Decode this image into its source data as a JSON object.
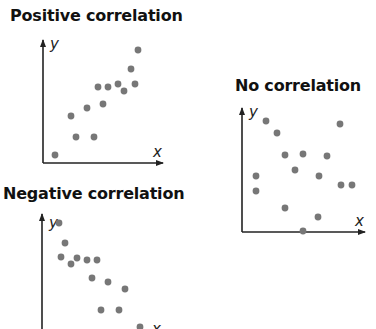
{
  "colors": {
    "dot": "#777777",
    "axis": "#222222",
    "title": "#111111"
  },
  "chart_data": [
    {
      "type": "scatter",
      "title": "Positive correlation",
      "xlabel": "x",
      "ylabel": "y",
      "grid": false,
      "note": "pixel coordinates on a 376x329 canvas",
      "axes": {
        "origin": [
          43,
          163
        ],
        "x_end": 163,
        "y_top": 39
      },
      "x": [
        55,
        71,
        76,
        87,
        94,
        98,
        103,
        108,
        118,
        124,
        131,
        135,
        138
      ],
      "y": [
        155,
        116,
        137,
        108,
        137,
        87,
        104,
        87,
        84,
        91,
        69,
        84,
        50
      ]
    },
    {
      "type": "scatter",
      "title": "No correlation",
      "xlabel": "x",
      "ylabel": "y",
      "grid": false,
      "axes": {
        "origin": [
          242,
          232
        ],
        "x_end": 365,
        "y_top": 107
      },
      "x": [
        266,
        277,
        285,
        303,
        327,
        340,
        256,
        256,
        295,
        319,
        341,
        352,
        285,
        318,
        303
      ],
      "y": [
        121,
        133,
        155,
        154,
        156,
        124,
        176,
        191,
        170,
        176,
        185,
        185,
        208,
        217,
        231
      ]
    },
    {
      "type": "scatter",
      "title": "Negative correlation",
      "xlabel": "x",
      "ylabel": "y",
      "grid": false,
      "axes": {
        "origin": [
          42,
          345
        ],
        "x_end": 165,
        "y_top": 213
      },
      "x": [
        59,
        65,
        61,
        71,
        77,
        87,
        97,
        92,
        108,
        125,
        101,
        119,
        140
      ],
      "y": [
        223,
        243,
        257,
        264,
        258,
        260,
        260,
        278,
        282,
        289,
        310,
        310,
        327
      ]
    }
  ],
  "labels": {
    "positive_title": "Positive correlation",
    "none_title": "No correlation",
    "negative_title": "Negative correlation",
    "x": "x",
    "y": "y"
  }
}
